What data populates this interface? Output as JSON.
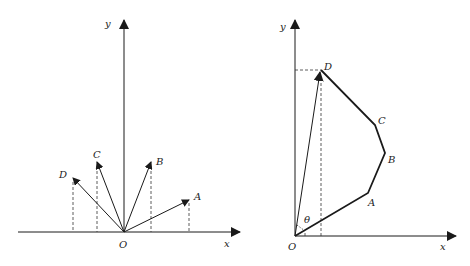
{
  "left_figure": {
    "axis_x_label": "x",
    "axis_y_label": "y",
    "origin_label": "O",
    "vectors": [
      {
        "label": "A",
        "tip": [
          189,
          200
        ]
      },
      {
        "label": "B",
        "tip": [
          151,
          162
        ]
      },
      {
        "label": "C",
        "tip": [
          97,
          162
        ]
      },
      {
        "label": "D",
        "tip": [
          73,
          178
        ]
      }
    ]
  },
  "right_figure": {
    "axis_x_label": "x",
    "axis_y_label": "y",
    "origin_label": "O",
    "angle_label": "θ",
    "polyline_points": [
      {
        "label": "A"
      },
      {
        "label": "B"
      },
      {
        "label": "C"
      },
      {
        "label": "D"
      }
    ]
  },
  "colors": {
    "line": "#1a1a1a",
    "dashed": "#333333"
  }
}
